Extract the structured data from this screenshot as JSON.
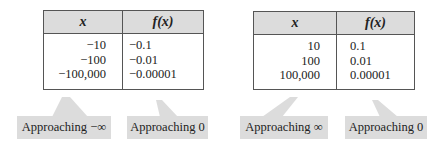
{
  "left_table": {
    "headers": {
      "x": "x",
      "fx": "f(x)"
    },
    "rows": [
      {
        "x": "−10",
        "fx": "−0.1"
      },
      {
        "x": "−100",
        "fx": "−0.01"
      },
      {
        "x": "−100,000",
        "fx": "−0.00001"
      }
    ],
    "callouts": {
      "x": "Approaching −∞",
      "fx": "Approaching 0"
    }
  },
  "right_table": {
    "headers": {
      "x": "x",
      "fx": "f(x)"
    },
    "rows": [
      {
        "x": "10",
        "fx": "0.1"
      },
      {
        "x": "100",
        "fx": "0.01"
      },
      {
        "x": "100,000",
        "fx": "0.00001"
      }
    ],
    "callouts": {
      "x": "Approaching ∞",
      "fx": "Approaching 0"
    }
  },
  "colors": {
    "header_bg": "#dcdcdc",
    "callout_bg": "#dcdcdc",
    "border": "#555555"
  }
}
